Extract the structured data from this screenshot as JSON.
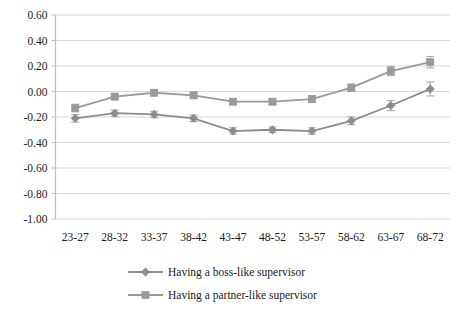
{
  "chart_data": {
    "type": "line",
    "title": "",
    "xlabel": "",
    "ylabel": "",
    "categories": [
      "23-27",
      "28-32",
      "33-37",
      "38-42",
      "43-47",
      "48-52",
      "53-57",
      "58-62",
      "63-67",
      "68-72"
    ],
    "ylim": [
      -1.0,
      0.6
    ],
    "ytick_labels": [
      "0.60",
      "0.40",
      "0.20",
      "0.00",
      "-0.20",
      "-0.40",
      "-0.60",
      "-0.80",
      "-1.00"
    ],
    "ytick_values": [
      0.6,
      0.4,
      0.2,
      0.0,
      -0.2,
      -0.4,
      -0.6,
      -0.8,
      -1.0
    ],
    "grid": true,
    "grid_axis": "y",
    "legend_position": "bottom",
    "error_bars": true,
    "series": [
      {
        "name": "Having a boss-like supervisor",
        "marker": "diamond",
        "color": "#8c8c8c",
        "values": [
          -0.21,
          -0.17,
          -0.18,
          -0.21,
          -0.31,
          -0.3,
          -0.31,
          -0.23,
          -0.11,
          0.02
        ],
        "errors": [
          0.03,
          0.025,
          0.025,
          0.025,
          0.025,
          0.022,
          0.025,
          0.03,
          0.04,
          0.055
        ]
      },
      {
        "name": "Having a partner-like supervisor",
        "marker": "square",
        "color": "#9a9a9a",
        "values": [
          -0.13,
          -0.04,
          -0.01,
          -0.03,
          -0.08,
          -0.08,
          -0.06,
          0.03,
          0.16,
          0.23
        ],
        "errors": [
          0.03,
          0.022,
          0.022,
          0.022,
          0.022,
          0.022,
          0.025,
          0.028,
          0.035,
          0.045
        ]
      }
    ]
  },
  "axis": {
    "axis_color": "#bfbfbf",
    "grid_color": "#d9d9d9"
  }
}
